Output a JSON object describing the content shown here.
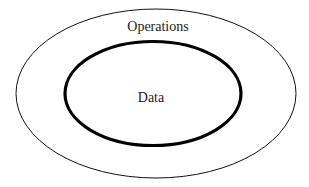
{
  "diagram": {
    "type": "nested-ellipses",
    "outer": {
      "label": "Operations",
      "stroke": "#111111"
    },
    "inner": {
      "label": "Data",
      "stroke": "#000000"
    }
  }
}
